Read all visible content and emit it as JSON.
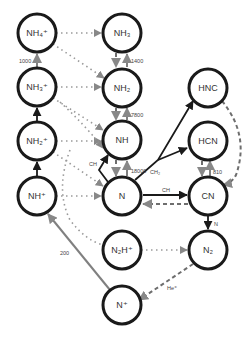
{
  "diagram": {
    "type": "reaction-network",
    "nodes": [
      {
        "id": "NH4p",
        "label": "NH₄⁺",
        "x": 37,
        "y": 33
      },
      {
        "id": "NH3",
        "label": "NH₃",
        "x": 122,
        "y": 33
      },
      {
        "id": "NH3p",
        "label": "NH₃⁺",
        "x": 37,
        "y": 87
      },
      {
        "id": "NH2",
        "label": "NH₂",
        "x": 122,
        "y": 88
      },
      {
        "id": "NH2p",
        "label": "NH₂⁺",
        "x": 37,
        "y": 141
      },
      {
        "id": "NH",
        "label": "NH",
        "x": 122,
        "y": 140
      },
      {
        "id": "NHp",
        "label": "NH⁺",
        "x": 37,
        "y": 196
      },
      {
        "id": "N",
        "label": "N",
        "x": 122,
        "y": 196
      },
      {
        "id": "HNC",
        "label": "HNC",
        "x": 208,
        "y": 88
      },
      {
        "id": "HCN",
        "label": "HCN",
        "x": 208,
        "y": 141
      },
      {
        "id": "CN",
        "label": "CN",
        "x": 208,
        "y": 196
      },
      {
        "id": "N2Hp",
        "label": "N₂H⁺",
        "x": 122,
        "y": 250
      },
      {
        "id": "N2",
        "label": "N₂",
        "x": 208,
        "y": 250
      },
      {
        "id": "Np",
        "label": "N⁺",
        "x": 122,
        "y": 305
      }
    ],
    "edge_labels": {
      "nh3p_nh4p": "1000",
      "nh2_nh3": "1400",
      "nh_nh2": "7800",
      "n_nh": "18000",
      "n_hnc_ch2": "CH₂",
      "n_cn_ch": "CH",
      "cn_hcn": "810",
      "cn_n2": "N",
      "np_nhp": "200",
      "n2_np": "He⁺",
      "ch_n_nh": "CH"
    },
    "colors": {
      "solid_dark": "#1a1a1a",
      "solid_gray": "#808080",
      "dotted": "#9a9a9a",
      "dashed": "#6e6e6e"
    }
  }
}
